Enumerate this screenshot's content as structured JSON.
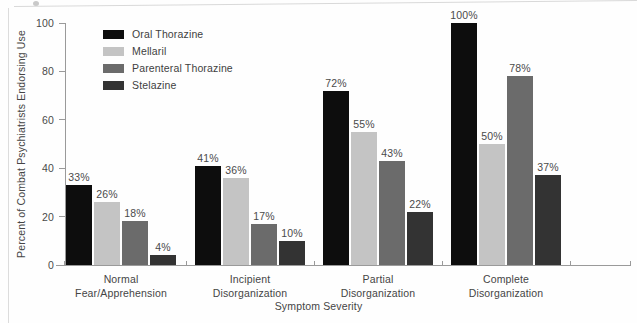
{
  "chart_data": {
    "type": "bar",
    "title": "",
    "xlabel": "Symptom Severity",
    "ylabel": "Percent of Combat Psychiatrists Endorsing Use",
    "ylim": [
      0,
      100
    ],
    "yticks": [
      0,
      20,
      40,
      60,
      80,
      100
    ],
    "ytick_labels": [
      "0",
      "20",
      "40",
      "60",
      "80",
      "100"
    ],
    "grid": false,
    "legend_position": "top-left inside",
    "categories": [
      "Normal\nFear/Apprehension",
      "Incipient\nDisorganization",
      "Partial\nDisorganization",
      "Complete\nDisorganization"
    ],
    "category_lines": [
      [
        "Normal",
        "Fear/Apprehension"
      ],
      [
        "Incipient",
        "Disorganization"
      ],
      [
        "Partial",
        "Disorganization"
      ],
      [
        "Complete",
        "Disorganization"
      ]
    ],
    "series": [
      {
        "name": "Oral Thorazine",
        "color": "#0d0d0d",
        "values": [
          33,
          41,
          72,
          100
        ],
        "labels": [
          "33%",
          "41%",
          "72%",
          "100%"
        ]
      },
      {
        "name": "Mellaril",
        "color": "#c4c4c4",
        "values": [
          26,
          36,
          55,
          50
        ],
        "labels": [
          "26%",
          "36%",
          "55%",
          "50%"
        ]
      },
      {
        "name": "Parenteral Thorazine",
        "color": "#6b6b6b",
        "values": [
          18,
          17,
          43,
          78
        ],
        "labels": [
          "18%",
          "17%",
          "43%",
          "78%"
        ]
      },
      {
        "name": "Stelazine",
        "color": "#333333",
        "values": [
          4,
          10,
          22,
          37
        ],
        "labels": [
          "4%",
          "10%",
          "22%",
          "37%"
        ]
      }
    ]
  },
  "legend": {
    "items": [
      {
        "label": "Oral Thorazine",
        "color": "#0d0d0d"
      },
      {
        "label": "Mellaril",
        "color": "#c4c4c4"
      },
      {
        "label": "Parenteral Thorazine",
        "color": "#6b6b6b"
      },
      {
        "label": "Stelazine",
        "color": "#333333"
      }
    ]
  },
  "axes": {
    "y_title": "Percent of Combat Psychiatrists Endorsing Use",
    "x_title": "Symptom Severity"
  }
}
